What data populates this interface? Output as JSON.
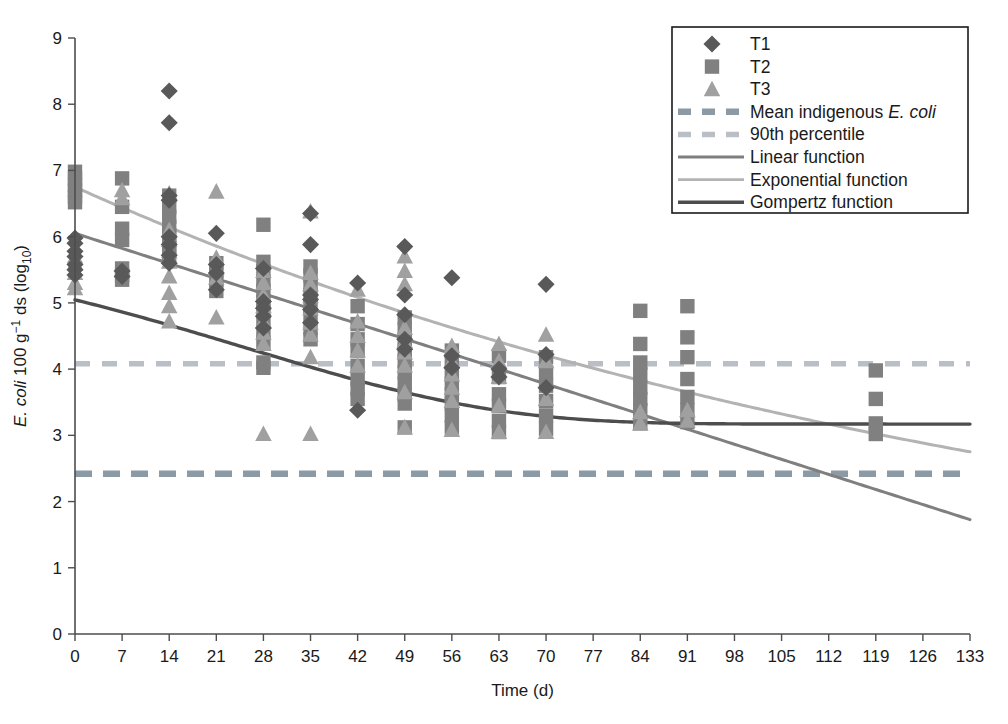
{
  "chart_data": {
    "type": "scatter",
    "title": "",
    "xlabel": "Time (d)",
    "ylabel": "E. coli 100 g⁻¹ ds (log₁₀)",
    "ylabel_parts": {
      "italic": "E. coli",
      "rest": " 100 g",
      "sup": "−1",
      "rest2": " ds (log",
      "sub": "10",
      "rest3": ")"
    },
    "xlim": [
      0,
      133
    ],
    "ylim": [
      0,
      9
    ],
    "xticks": [
      0,
      7,
      14,
      21,
      28,
      35,
      42,
      49,
      56,
      63,
      70,
      77,
      84,
      91,
      98,
      105,
      112,
      119,
      126,
      133
    ],
    "yticks": [
      0,
      1,
      2,
      3,
      4,
      5,
      6,
      7,
      8,
      9
    ],
    "grid": false,
    "legend_position": "top-right",
    "colors": {
      "T1": "#595959",
      "T2": "#808080",
      "T3": "#a0a0a0",
      "mean_indigenous": "#8c9aa6",
      "percentile_90": "#b9bfc4",
      "linear": "#7f7f7f",
      "exponential": "#b3b3b3",
      "gompertz": "#4d4d4d",
      "axis": "#4d4d4d",
      "text": "#1a1a1a"
    },
    "reference_lines": [
      {
        "name": "Mean indigenous E. coli",
        "value": 2.42,
        "style": "dashed",
        "color": "#8c9aa6"
      },
      {
        "name": "90th percentile",
        "value": 4.08,
        "style": "dashed",
        "color": "#b9bfc4"
      }
    ],
    "series": [
      {
        "name": "T1",
        "marker": "diamond",
        "color": "#595959",
        "points": [
          [
            0,
            5.98
          ],
          [
            0,
            5.9
          ],
          [
            0,
            5.78
          ],
          [
            0,
            5.7
          ],
          [
            0,
            5.58
          ],
          [
            0,
            5.5
          ],
          [
            0,
            5.42
          ],
          [
            7,
            5.48
          ],
          [
            7,
            5.4
          ],
          [
            14,
            8.2
          ],
          [
            14,
            7.72
          ],
          [
            14,
            6.62
          ],
          [
            14,
            6.55
          ],
          [
            14,
            6.0
          ],
          [
            14,
            5.88
          ],
          [
            14,
            5.72
          ],
          [
            14,
            5.6
          ],
          [
            21,
            6.05
          ],
          [
            21,
            5.58
          ],
          [
            21,
            5.45
          ],
          [
            21,
            5.2
          ],
          [
            28,
            5.52
          ],
          [
            28,
            5.02
          ],
          [
            28,
            4.92
          ],
          [
            28,
            4.8
          ],
          [
            28,
            4.62
          ],
          [
            35,
            6.35
          ],
          [
            35,
            5.88
          ],
          [
            35,
            5.12
          ],
          [
            35,
            5.05
          ],
          [
            35,
            4.9
          ],
          [
            35,
            4.7
          ],
          [
            42,
            5.3
          ],
          [
            42,
            3.38
          ],
          [
            49,
            5.85
          ],
          [
            49,
            5.12
          ],
          [
            49,
            4.82
          ],
          [
            49,
            4.45
          ],
          [
            49,
            4.3
          ],
          [
            56,
            5.38
          ],
          [
            56,
            4.2
          ],
          [
            56,
            4.02
          ],
          [
            63,
            4.0
          ],
          [
            63,
            3.88
          ],
          [
            70,
            5.28
          ],
          [
            70,
            4.22
          ],
          [
            70,
            3.72
          ]
        ]
      },
      {
        "name": "T2",
        "marker": "square",
        "color": "#808080",
        "points": [
          [
            0,
            6.98
          ],
          [
            0,
            6.88
          ],
          [
            0,
            6.78
          ],
          [
            0,
            6.7
          ],
          [
            0,
            6.6
          ],
          [
            0,
            6.52
          ],
          [
            7,
            6.88
          ],
          [
            7,
            6.45
          ],
          [
            7,
            6.12
          ],
          [
            7,
            5.95
          ],
          [
            7,
            5.52
          ],
          [
            7,
            5.42
          ],
          [
            7,
            5.35
          ],
          [
            14,
            6.62
          ],
          [
            14,
            6.45
          ],
          [
            14,
            6.3
          ],
          [
            14,
            6.15
          ],
          [
            14,
            6.02
          ],
          [
            14,
            5.92
          ],
          [
            14,
            5.82
          ],
          [
            14,
            5.7
          ],
          [
            21,
            5.6
          ],
          [
            21,
            5.48
          ],
          [
            21,
            5.35
          ],
          [
            21,
            5.18
          ],
          [
            28,
            6.18
          ],
          [
            28,
            5.62
          ],
          [
            28,
            5.48
          ],
          [
            28,
            5.32
          ],
          [
            28,
            5.18
          ],
          [
            28,
            5.02
          ],
          [
            28,
            4.88
          ],
          [
            28,
            4.72
          ],
          [
            28,
            4.55
          ],
          [
            28,
            4.4
          ],
          [
            28,
            4.1
          ],
          [
            28,
            4.02
          ],
          [
            35,
            5.55
          ],
          [
            35,
            5.42
          ],
          [
            35,
            5.28
          ],
          [
            35,
            5.12
          ],
          [
            35,
            4.95
          ],
          [
            35,
            4.8
          ],
          [
            35,
            4.62
          ],
          [
            35,
            4.45
          ],
          [
            42,
            4.95
          ],
          [
            42,
            4.68
          ],
          [
            42,
            4.45
          ],
          [
            42,
            4.28
          ],
          [
            42,
            4.05
          ],
          [
            42,
            3.85
          ],
          [
            42,
            3.7
          ],
          [
            42,
            3.55
          ],
          [
            49,
            4.78
          ],
          [
            49,
            4.6
          ],
          [
            49,
            4.45
          ],
          [
            49,
            4.28
          ],
          [
            49,
            4.12
          ],
          [
            49,
            3.95
          ],
          [
            49,
            3.78
          ],
          [
            49,
            3.62
          ],
          [
            49,
            3.48
          ],
          [
            49,
            3.12
          ],
          [
            56,
            4.28
          ],
          [
            56,
            4.12
          ],
          [
            56,
            3.95
          ],
          [
            56,
            3.78
          ],
          [
            56,
            3.62
          ],
          [
            56,
            3.48
          ],
          [
            56,
            3.3
          ],
          [
            56,
            3.12
          ],
          [
            63,
            4.2
          ],
          [
            63,
            3.88
          ],
          [
            63,
            3.62
          ],
          [
            63,
            3.45
          ],
          [
            63,
            3.22
          ],
          [
            63,
            3.05
          ],
          [
            70,
            4.18
          ],
          [
            70,
            3.95
          ],
          [
            70,
            3.75
          ],
          [
            70,
            3.52
          ],
          [
            70,
            3.3
          ],
          [
            70,
            3.1
          ],
          [
            84,
            4.88
          ],
          [
            84,
            4.38
          ],
          [
            84,
            4.1
          ],
          [
            84,
            3.92
          ],
          [
            84,
            3.72
          ],
          [
            84,
            3.55
          ],
          [
            84,
            3.38
          ],
          [
            84,
            3.18
          ],
          [
            91,
            4.95
          ],
          [
            91,
            4.48
          ],
          [
            91,
            4.18
          ],
          [
            91,
            3.85
          ],
          [
            91,
            3.58
          ],
          [
            91,
            3.38
          ],
          [
            91,
            3.2
          ],
          [
            119,
            3.98
          ],
          [
            119,
            3.55
          ],
          [
            119,
            3.18
          ],
          [
            119,
            3.02
          ]
        ]
      },
      {
        "name": "T3",
        "marker": "triangle",
        "color": "#a0a0a0",
        "points": [
          [
            0,
            5.7
          ],
          [
            0,
            5.6
          ],
          [
            0,
            5.45
          ],
          [
            0,
            5.3
          ],
          [
            0,
            5.22
          ],
          [
            7,
            6.7
          ],
          [
            7,
            6.58
          ],
          [
            14,
            6.65
          ],
          [
            14,
            6.1
          ],
          [
            14,
            5.95
          ],
          [
            14,
            5.78
          ],
          [
            14,
            5.62
          ],
          [
            14,
            5.4
          ],
          [
            14,
            5.15
          ],
          [
            14,
            4.95
          ],
          [
            14,
            4.72
          ],
          [
            21,
            6.68
          ],
          [
            21,
            5.68
          ],
          [
            21,
            5.52
          ],
          [
            21,
            5.38
          ],
          [
            21,
            4.78
          ],
          [
            28,
            5.48
          ],
          [
            28,
            5.3
          ],
          [
            28,
            5.12
          ],
          [
            28,
            4.95
          ],
          [
            28,
            4.72
          ],
          [
            28,
            4.55
          ],
          [
            28,
            4.38
          ],
          [
            28,
            3.02
          ],
          [
            35,
            6.38
          ],
          [
            35,
            5.45
          ],
          [
            35,
            5.28
          ],
          [
            35,
            5.1
          ],
          [
            35,
            4.92
          ],
          [
            35,
            4.7
          ],
          [
            35,
            4.52
          ],
          [
            35,
            4.18
          ],
          [
            35,
            3.02
          ],
          [
            42,
            5.2
          ],
          [
            42,
            4.72
          ],
          [
            42,
            4.5
          ],
          [
            42,
            4.28
          ],
          [
            42,
            4.05
          ],
          [
            49,
            5.7
          ],
          [
            49,
            5.48
          ],
          [
            49,
            5.28
          ],
          [
            49,
            4.62
          ],
          [
            49,
            4.42
          ],
          [
            49,
            4.25
          ],
          [
            49,
            4.05
          ],
          [
            49,
            3.65
          ],
          [
            49,
            3.12
          ],
          [
            56,
            4.35
          ],
          [
            56,
            4.12
          ],
          [
            56,
            3.92
          ],
          [
            56,
            3.72
          ],
          [
            56,
            3.52
          ],
          [
            56,
            3.08
          ],
          [
            63,
            4.38
          ],
          [
            63,
            4.12
          ],
          [
            63,
            3.88
          ],
          [
            63,
            3.45
          ],
          [
            63,
            3.05
          ],
          [
            70,
            4.52
          ],
          [
            70,
            4.12
          ],
          [
            70,
            3.55
          ],
          [
            70,
            3.05
          ],
          [
            84,
            3.35
          ],
          [
            84,
            3.18
          ],
          [
            91,
            3.38
          ],
          [
            91,
            3.22
          ]
        ]
      }
    ],
    "fits": [
      {
        "name": "Linear function",
        "type": "linear",
        "color": "#7f7f7f",
        "intercept": 6.05,
        "slope": -0.0325,
        "x_range": [
          0,
          133
        ]
      },
      {
        "name": "Exponential function",
        "type": "exponential",
        "color": "#b3b3b3",
        "a": 6.75,
        "b": -0.00675,
        "x_range": [
          0,
          133
        ]
      },
      {
        "name": "Gompertz function",
        "type": "gompertz",
        "color": "#4d4d4d",
        "asymptote": 3.17,
        "amplitude": 3.08,
        "rate": 0.027,
        "lag": 26.0,
        "x_range": [
          0,
          133
        ]
      }
    ],
    "legend": {
      "entries": [
        {
          "label": "T1",
          "marker": "diamond",
          "color": "#595959"
        },
        {
          "label": "T2",
          "marker": "square",
          "color": "#808080"
        },
        {
          "label": "T3",
          "marker": "triangle",
          "color": "#a0a0a0"
        },
        {
          "label": "Mean indigenous E. coli",
          "label_plain": "Mean indigenous ",
          "label_italic": "E. coli",
          "marker": "dashed-thick",
          "color": "#8c9aa6"
        },
        {
          "label": "90th percentile",
          "marker": "dashed-thin",
          "color": "#b9bfc4"
        },
        {
          "label": "Linear function",
          "marker": "line",
          "color": "#7f7f7f"
        },
        {
          "label": "Exponential function",
          "marker": "line",
          "color": "#b3b3b3"
        },
        {
          "label": "Gompertz function",
          "marker": "line",
          "color": "#4d4d4d"
        }
      ]
    }
  }
}
